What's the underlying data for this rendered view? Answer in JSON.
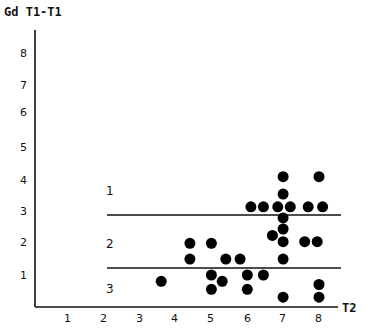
{
  "chart_data": {
    "type": "scatter",
    "title": "",
    "ylabel": "Gd T1-T1",
    "xlabel": "T2",
    "xlim": [
      0,
      8.5
    ],
    "ylim": [
      0,
      8.5
    ],
    "x_ticks": [
      1,
      2,
      3,
      4,
      5,
      6,
      7,
      8
    ],
    "y_ticks": [
      1,
      2,
      3,
      4,
      5,
      6,
      7,
      8
    ],
    "grid": false,
    "legend": null,
    "thresholds": [
      {
        "y": 2.9,
        "x_start": 2.1,
        "x_end": 8.6
      },
      {
        "y": 1.23,
        "x_start": 2.1,
        "x_end": 8.6
      }
    ],
    "regions": [
      {
        "label": "1",
        "x": 2.1,
        "y": 3.6
      },
      {
        "label": "2",
        "x": 2.1,
        "y": 1.95
      },
      {
        "label": "3",
        "x": 2.1,
        "y": 0.55
      }
    ],
    "series": [
      {
        "name": "cases",
        "points": [
          {
            "x": 3.6,
            "y": 0.8
          },
          {
            "x": 4.4,
            "y": 2.0
          },
          {
            "x": 5.0,
            "y": 2.0
          },
          {
            "x": 4.4,
            "y": 1.5
          },
          {
            "x": 5.4,
            "y": 1.5
          },
          {
            "x": 5.8,
            "y": 1.5
          },
          {
            "x": 5.0,
            "y": 1.0
          },
          {
            "x": 5.3,
            "y": 0.8
          },
          {
            "x": 5.0,
            "y": 0.55
          },
          {
            "x": 6.0,
            "y": 1.0
          },
          {
            "x": 6.45,
            "y": 1.0
          },
          {
            "x": 6.0,
            "y": 0.55
          },
          {
            "x": 6.7,
            "y": 2.25
          },
          {
            "x": 7.0,
            "y": 4.1
          },
          {
            "x": 8.0,
            "y": 4.1
          },
          {
            "x": 7.0,
            "y": 3.55
          },
          {
            "x": 6.1,
            "y": 3.15
          },
          {
            "x": 6.45,
            "y": 3.15
          },
          {
            "x": 6.85,
            "y": 3.15
          },
          {
            "x": 7.2,
            "y": 3.15
          },
          {
            "x": 7.7,
            "y": 3.15
          },
          {
            "x": 8.1,
            "y": 3.15
          },
          {
            "x": 7.0,
            "y": 2.8
          },
          {
            "x": 7.0,
            "y": 2.45
          },
          {
            "x": 7.0,
            "y": 2.05
          },
          {
            "x": 7.6,
            "y": 2.05
          },
          {
            "x": 7.95,
            "y": 2.05
          },
          {
            "x": 7.0,
            "y": 1.5
          },
          {
            "x": 7.0,
            "y": 0.3
          },
          {
            "x": 8.0,
            "y": 0.7
          },
          {
            "x": 8.0,
            "y": 0.3
          }
        ]
      }
    ]
  },
  "labels": {
    "ylabel": "Gd T1-T1",
    "xlabel": "T2",
    "x_ticks": [
      "1",
      "2",
      "3",
      "4",
      "5",
      "6",
      "7",
      "8"
    ],
    "y_ticks": [
      "1",
      "2",
      "3",
      "4",
      "5",
      "6",
      "7",
      "8"
    ],
    "regions": [
      "1",
      "2",
      "3"
    ]
  },
  "style": {
    "axis_color": "#111111",
    "point_color": "#000000",
    "background": "#ffffff"
  }
}
